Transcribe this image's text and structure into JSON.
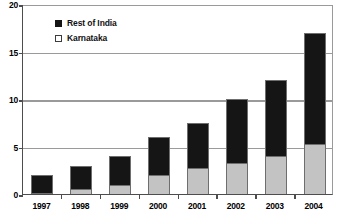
{
  "chart_data": {
    "type": "bar",
    "subtype": "stacked-column",
    "title": "",
    "subtitle": "",
    "xlabel": "",
    "ylabel": "",
    "categories": [
      "1997",
      "1998",
      "1999",
      "2000",
      "2001",
      "2002",
      "2003",
      "2004"
    ],
    "series": [
      {
        "name": "Karnataka",
        "color": "#c3c3c3",
        "stack_position": "bottom",
        "values": [
          0.1,
          0.5,
          1.0,
          2.0,
          2.7,
          3.3,
          4.0,
          5.3
        ]
      },
      {
        "name": "Rest of India",
        "color": "#151515",
        "stack_position": "top",
        "values": [
          1.9,
          2.5,
          3.0,
          4.0,
          4.8,
          6.7,
          8.0,
          11.7
        ]
      }
    ],
    "totals": [
      2.0,
      3.0,
      4.0,
      6.0,
      7.5,
      10.0,
      12.0,
      17.0
    ],
    "ylim": [
      0,
      20
    ],
    "ytick_labels": [
      "0",
      "5",
      "10",
      "15",
      "20"
    ],
    "ytick_values": [
      0,
      5,
      10,
      15,
      20
    ],
    "grid": true,
    "grid_axis": "y",
    "legend_position": "top-left-inside",
    "legend_entries": [
      "Rest of India",
      "Karnataka"
    ]
  },
  "legend": {
    "items": [
      {
        "label": "Rest of India",
        "marker": "filled-square-icon"
      },
      {
        "label": "Karnataka",
        "marker": "outlined-square-icon"
      }
    ]
  },
  "axes": {
    "y": {
      "ticks": [
        {
          "label": "20",
          "value": 20
        },
        {
          "label": "15",
          "value": 15
        },
        {
          "label": "10",
          "value": 10
        },
        {
          "label": "5",
          "value": 5
        },
        {
          "label": "0",
          "value": 0
        }
      ]
    },
    "x": {
      "ticks": [
        {
          "label": "1997"
        },
        {
          "label": "1998"
        },
        {
          "label": "1999"
        },
        {
          "label": "2000"
        },
        {
          "label": "2001"
        },
        {
          "label": "2002"
        },
        {
          "label": "2003"
        },
        {
          "label": "2004"
        }
      ]
    }
  },
  "colors": {
    "series_top": "#151515",
    "series_bottom": "#c3c3c3",
    "gridline": "#9a9a9a",
    "axis": "#4d4d4d",
    "background": "#ffffff",
    "text": "#000000"
  }
}
